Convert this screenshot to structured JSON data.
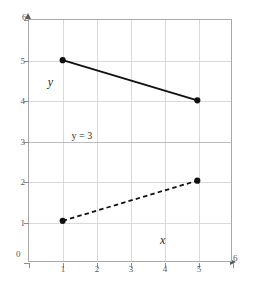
{
  "chart_data": {
    "type": "line",
    "title": "",
    "subtitle": "",
    "xlabel": "x",
    "ylabel": "y",
    "xlim": [
      0,
      6
    ],
    "ylim": [
      0,
      6
    ],
    "xticks": [
      0,
      1,
      2,
      3,
      4,
      5,
      6
    ],
    "yticks": [
      0,
      1,
      2,
      3,
      4,
      5,
      6
    ],
    "xtick_labels": [
      "0",
      "1",
      "2",
      "3",
      "4",
      "5",
      "6"
    ],
    "ytick_labels": [
      "0",
      "1",
      "2",
      "3",
      "4",
      "5",
      "6"
    ],
    "grid": true,
    "legend": "none",
    "series": [
      {
        "name": "solid-segment",
        "style": "solid",
        "color": "#111111",
        "marker": "filled-circle",
        "x": [
          1,
          5
        ],
        "y": [
          5,
          4
        ],
        "points": [
          [
            1,
            5
          ],
          [
            5,
            4
          ]
        ]
      },
      {
        "name": "dashed-segment",
        "style": "dashed",
        "color": "#111111",
        "marker": "filled-circle",
        "x": [
          1,
          5
        ],
        "y": [
          1,
          2
        ],
        "points": [
          [
            1,
            1
          ],
          [
            5,
            2
          ]
        ]
      }
    ],
    "annotations": [
      {
        "name": "y-equals-3",
        "text": "y = 3",
        "x": 1.25,
        "y": 3.12
      }
    ],
    "reference_lines": [
      {
        "name": "y-equals-3-line",
        "orientation": "horizontal",
        "value": 3
      }
    ]
  },
  "labels": {
    "y_axis_name": "y",
    "x_axis_name": "x",
    "origin": "0",
    "y_top": "6",
    "x_right": "6"
  },
  "colors": {
    "line": "#111111",
    "grid": "#d9d9d9",
    "frame": "#a8a8a8",
    "tick_text": "#5a5a5a",
    "background": "#ffffff"
  }
}
